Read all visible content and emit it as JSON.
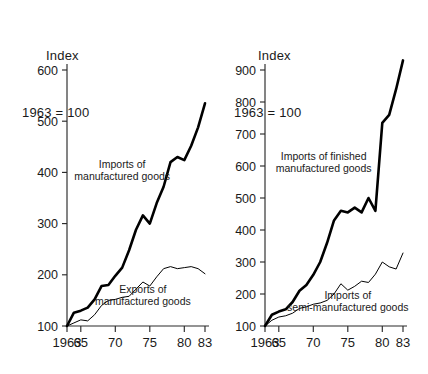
{
  "page": {
    "width": 428,
    "height": 374,
    "background": "#ffffff",
    "ink": "#000000"
  },
  "chart_data": [
    {
      "id": "left",
      "type": "line",
      "title": "Index\n1963 = 100",
      "title_line1": "Index",
      "title_line2": "1963 = 100",
      "xlabel": "",
      "ylabel": "Index 1963 = 100",
      "xlim": [
        1963,
        1983
      ],
      "ylim": [
        100,
        600
      ],
      "grid": false,
      "legend": "inline-annotation",
      "yticks": [
        100,
        200,
        300,
        400,
        500,
        600
      ],
      "ytick_labels": [
        "100",
        "200",
        "300",
        "400",
        "500",
        "600"
      ],
      "xticks": [
        1963,
        1965,
        1970,
        1975,
        1980,
        1983
      ],
      "xtick_labels": [
        "1963",
        "65",
        "70",
        "75",
        "80",
        "83"
      ],
      "x": [
        1963,
        1964,
        1965,
        1966,
        1967,
        1968,
        1969,
        1970,
        1971,
        1972,
        1973,
        1974,
        1975,
        1976,
        1977,
        1978,
        1979,
        1980,
        1981,
        1982,
        1983
      ],
      "series": [
        {
          "name": "Imports of manufactured goods",
          "label": "Imports of\nmanufactured goods",
          "label_line1": "Imports of",
          "label_line2": "manufactured goods",
          "style": "thick",
          "color": "#000000",
          "values": [
            100,
            126,
            130,
            136,
            152,
            178,
            180,
            198,
            214,
            248,
            288,
            316,
            300,
            340,
            372,
            420,
            430,
            424,
            452,
            488,
            535
          ]
        },
        {
          "name": "Exports of manufactured goods",
          "label": "Exports of\nmanufactured goods",
          "label_line1": "Exports of",
          "label_line2": "manufactured goods",
          "style": "thin",
          "color": "#000000",
          "values": [
            100,
            106,
            112,
            110,
            122,
            140,
            150,
            152,
            156,
            158,
            172,
            186,
            178,
            196,
            212,
            216,
            212,
            214,
            216,
            212,
            202
          ]
        }
      ],
      "annotations": [
        {
          "text": "Imports of manufactured goods",
          "x": 1971.0,
          "y": 408
        },
        {
          "text": "Exports of manufactured goods",
          "x": 1974.0,
          "y": 165
        }
      ]
    },
    {
      "id": "right",
      "type": "line",
      "title": "Index\n1963 = 100",
      "title_line1": "Index",
      "title_line2": "1963 = 100",
      "xlabel": "",
      "ylabel": "Index 1963 = 100",
      "xlim": [
        1963,
        1983
      ],
      "ylim": [
        100,
        900
      ],
      "grid": false,
      "legend": "inline-annotation",
      "yticks": [
        100,
        200,
        300,
        400,
        500,
        600,
        700,
        800,
        900
      ],
      "ytick_labels": [
        "100",
        "200",
        "300",
        "400",
        "500",
        "600",
        "700",
        "800",
        "900"
      ],
      "xticks": [
        1963,
        1965,
        1970,
        1975,
        1980,
        1983
      ],
      "xtick_labels": [
        "1963",
        "65",
        "70",
        "75",
        "80",
        "83"
      ],
      "x": [
        1963,
        1964,
        1965,
        1966,
        1967,
        1968,
        1969,
        1970,
        1971,
        1972,
        1973,
        1974,
        1975,
        1976,
        1977,
        1978,
        1979,
        1980,
        1981,
        1982,
        1983
      ],
      "series": [
        {
          "name": "Imports of finished manufactured goods",
          "label": "Imports of finished\nmanufactured goods",
          "label_line1": "Imports of finished",
          "label_line2": "manufactured goods",
          "style": "thick",
          "color": "#000000",
          "values": [
            100,
            135,
            145,
            152,
            175,
            210,
            228,
            260,
            300,
            360,
            430,
            460,
            455,
            470,
            455,
            500,
            460,
            735,
            760,
            840,
            930
          ]
        },
        {
          "name": "Imports of semi-manufactured goods",
          "label": "Imports of\nsemi-manufactured goods",
          "label_line1": "Imports of",
          "label_line2": "semi-manufactured goods",
          "style": "thin",
          "color": "#000000",
          "values": [
            100,
            118,
            128,
            132,
            140,
            155,
            160,
            168,
            172,
            180,
            200,
            232,
            212,
            224,
            240,
            236,
            262,
            300,
            285,
            278,
            328
          ]
        }
      ],
      "annotations": [
        {
          "text": "Imports of finished manufactured goods",
          "x": 1971.5,
          "y": 620
        },
        {
          "text": "Imports of semi-manufactured goods",
          "x": 1975.0,
          "y": 185
        }
      ]
    }
  ]
}
